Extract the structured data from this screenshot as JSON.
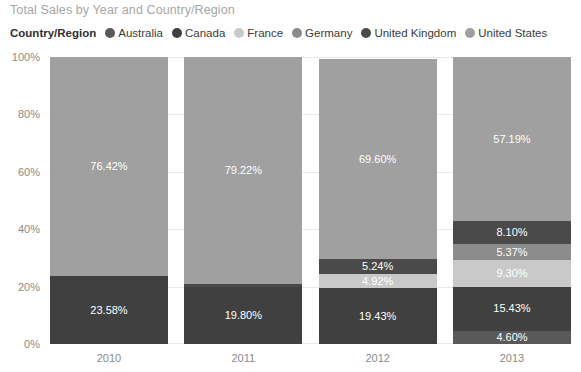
{
  "chart_data": {
    "type": "bar",
    "subtype": "stacked-100-percent",
    "title": "Total Sales by Year and Country/Region",
    "xlabel": "",
    "ylabel": "",
    "categories": [
      "2010",
      "2011",
      "2012",
      "2013"
    ],
    "ylim": [
      0,
      100
    ],
    "ytick_labels": [
      "0%",
      "20%",
      "40%",
      "60%",
      "80%",
      "100%"
    ],
    "ytick_values": [
      0,
      20,
      40,
      60,
      80,
      100
    ],
    "grid": true,
    "legend_position": "top",
    "legend_title": "Country/Region",
    "series": [
      {
        "name": "Australia",
        "color": "#595959",
        "values": [
          0,
          0,
          0,
          4.6
        ],
        "labels": [
          "",
          "",
          "",
          "4.60%"
        ]
      },
      {
        "name": "Canada",
        "color": "#404040",
        "values": [
          23.58,
          19.8,
          19.43,
          15.43
        ],
        "labels": [
          "23.58%",
          "19.80%",
          "19.43%",
          "15.43%"
        ]
      },
      {
        "name": "France",
        "color": "#c9c9c9",
        "values": [
          0,
          0,
          4.92,
          9.3
        ],
        "labels": [
          "",
          "",
          "4.92%",
          "9.30%"
        ]
      },
      {
        "name": "Germany",
        "color": "#8c8c8c",
        "values": [
          0,
          0,
          0,
          5.37
        ],
        "labels": [
          "",
          "",
          "",
          "5.37%"
        ]
      },
      {
        "name": "United Kingdom",
        "color": "#4a4a4a",
        "values": [
          0,
          0.98,
          5.24,
          8.1
        ],
        "labels": [
          "",
          "",
          "5.24%",
          "8.10%"
        ]
      },
      {
        "name": "United States",
        "color": "#a0a0a0",
        "values": [
          76.42,
          79.22,
          69.6,
          57.19
        ],
        "labels": [
          "76.42%",
          "79.22%",
          "69.60%",
          "57.19%"
        ]
      }
    ]
  },
  "colors": {
    "background": "#ffffff",
    "title_text": "#a6a6a6",
    "axis_text": "#8a8a8a",
    "legend_text": "#3b3b3b",
    "gridline": "#e9e9e9",
    "value_label": "#ffffff"
  }
}
